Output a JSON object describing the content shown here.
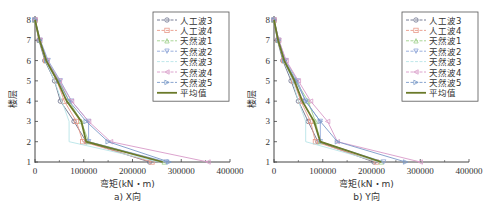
{
  "chart_data": [
    {
      "type": "line",
      "caption": "a) X向",
      "xlabel": "弯矩(kN・m)",
      "ylabel": "楼层",
      "xlim": [
        0,
        400000
      ],
      "ylim": [
        1,
        8
      ],
      "xticks": [
        0,
        100000,
        200000,
        300000,
        400000
      ],
      "yticks": [
        1,
        2,
        3,
        4,
        5,
        6,
        7,
        8
      ],
      "legend_position": "upper right",
      "y": [
        1,
        2,
        3,
        4,
        5,
        6,
        7,
        8
      ],
      "series": [
        {
          "name": "人工波3",
          "color": "#6a6f8a",
          "marker": "o",
          "values": [
            235000,
            105000,
            80000,
            52000,
            40000,
            20000,
            8000,
            0
          ]
        },
        {
          "name": "人工波4",
          "color": "#e89a8a",
          "marker": "s",
          "values": [
            240000,
            98000,
            85000,
            60000,
            45000,
            22000,
            9000,
            0
          ]
        },
        {
          "name": "天然波1",
          "color": "#9fd08a",
          "marker": "^",
          "values": [
            265000,
            110000,
            95000,
            70000,
            50000,
            25000,
            10000,
            0
          ]
        },
        {
          "name": "天然波2",
          "color": "#8fa6d8",
          "marker": "v",
          "values": [
            270000,
            110000,
            110000,
            75000,
            52000,
            27000,
            11000,
            0
          ]
        },
        {
          "name": "天然波3",
          "color": "#b8e4e8",
          "marker": "none",
          "values": [
            255000,
            70000,
            70000,
            55000,
            40000,
            22000,
            9000,
            0
          ]
        },
        {
          "name": "天然波4",
          "color": "#d89ac8",
          "marker": "<",
          "values": [
            355000,
            155000,
            110000,
            75000,
            50000,
            25000,
            10000,
            0
          ]
        },
        {
          "name": "天然波5",
          "color": "#7a9ac8",
          "marker": ">",
          "values": [
            275000,
            150000,
            105000,
            70000,
            48000,
            24000,
            10000,
            0
          ]
        },
        {
          "name": "平均值",
          "color": "#6b7a2a",
          "marker": "none",
          "bold": true,
          "values": [
            262000,
            105000,
            95000,
            65000,
            46000,
            23000,
            9500,
            0
          ]
        }
      ]
    },
    {
      "type": "line",
      "caption": "b) Y向",
      "xlabel": "弯矩(kN・m)",
      "ylabel": "楼层",
      "xlim": [
        0,
        400000
      ],
      "ylim": [
        1,
        8
      ],
      "xticks": [
        0,
        100000,
        200000,
        300000,
        400000
      ],
      "yticks": [
        1,
        2,
        3,
        4,
        5,
        6,
        7,
        8
      ],
      "legend_position": "upper right",
      "y": [
        1,
        2,
        3,
        4,
        5,
        6,
        7,
        8
      ],
      "series": [
        {
          "name": "人工波3",
          "color": "#6a6f8a",
          "marker": "o",
          "values": [
            205000,
            90000,
            70000,
            50000,
            35000,
            18000,
            7000,
            0
          ]
        },
        {
          "name": "人工波4",
          "color": "#e89a8a",
          "marker": "s",
          "values": [
            210000,
            85000,
            75000,
            55000,
            40000,
            20000,
            8000,
            0
          ]
        },
        {
          "name": "天然波1",
          "color": "#9fd08a",
          "marker": "^",
          "values": [
            220000,
            95000,
            85000,
            70000,
            45000,
            22000,
            9000,
            0
          ]
        },
        {
          "name": "天然波2",
          "color": "#8fa6d8",
          "marker": "v",
          "values": [
            225000,
            95000,
            95000,
            65000,
            48000,
            24000,
            10000,
            0
          ]
        },
        {
          "name": "天然波3",
          "color": "#b8e4e8",
          "marker": "none",
          "values": [
            215000,
            65000,
            65000,
            50000,
            38000,
            20000,
            8000,
            0
          ]
        },
        {
          "name": "天然波4",
          "color": "#d89ac8",
          "marker": "<",
          "values": [
            300000,
            130000,
            110000,
            75000,
            50000,
            25000,
            10000,
            0
          ]
        },
        {
          "name": "天然波5",
          "color": "#7a9ac8",
          "marker": ">",
          "values": [
            270000,
            130000,
            95000,
            65000,
            45000,
            22000,
            9000,
            0
          ]
        },
        {
          "name": "平均值",
          "color": "#6b7a2a",
          "marker": "none",
          "bold": true,
          "values": [
            220000,
            95000,
            82000,
            58000,
            42000,
            21000,
            8500,
            0
          ]
        }
      ]
    }
  ]
}
